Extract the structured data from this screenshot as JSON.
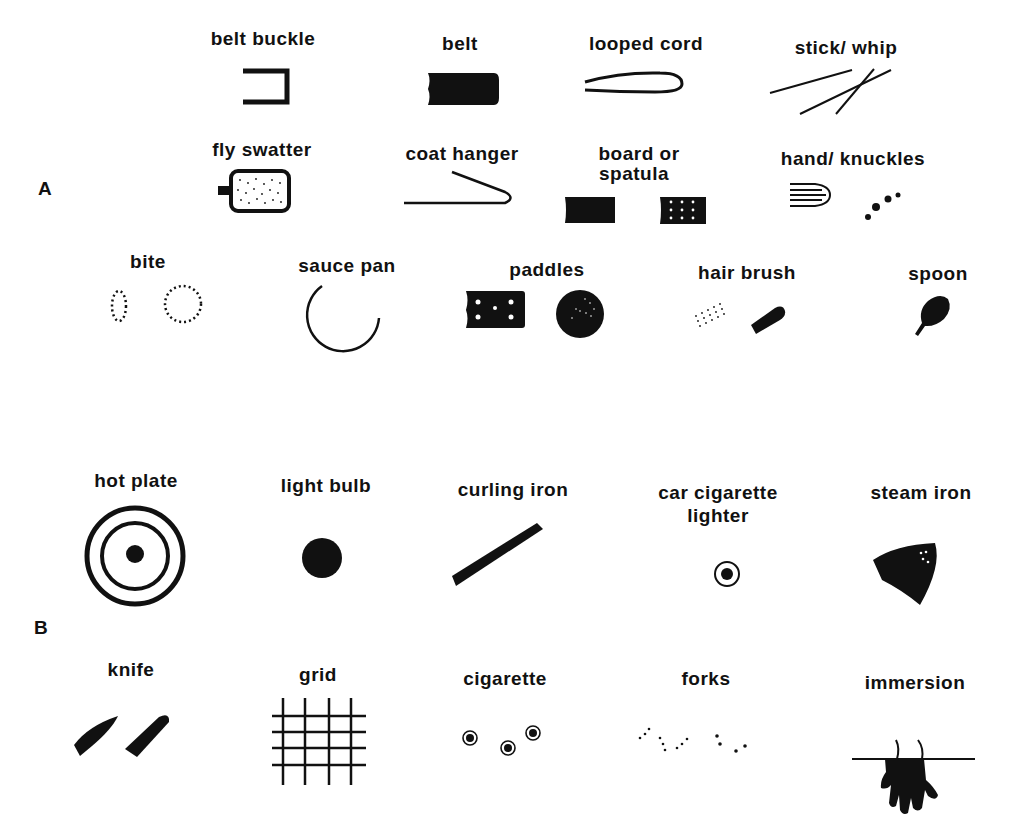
{
  "sections": {
    "A": {
      "label": "A"
    },
    "B": {
      "label": "B"
    }
  },
  "items": {
    "belt_buckle": {
      "label": "belt buckle"
    },
    "belt": {
      "label": "belt"
    },
    "looped_cord": {
      "label": "looped cord"
    },
    "stick_whip": {
      "label": "stick/ whip"
    },
    "fly_swatter": {
      "label": "fly  swatter"
    },
    "coat_hanger": {
      "label": "coat hanger"
    },
    "board_spatula": {
      "label_line1": "board or",
      "label_line2": "spatula"
    },
    "hand_knuckles": {
      "label": "hand/ knuckles"
    },
    "bite": {
      "label": "bite"
    },
    "sauce_pan": {
      "label": "sauce  pan"
    },
    "paddles": {
      "label": "paddles"
    },
    "hair_brush": {
      "label": "hair  brush"
    },
    "spoon": {
      "label": "spoon"
    },
    "hot_plate": {
      "label": "hot plate"
    },
    "light_bulb": {
      "label": "light bulb"
    },
    "curling_iron": {
      "label": "curling iron"
    },
    "car_cigarette_lighter": {
      "label_line1": "car  cigarette",
      "label_line2": "lighter"
    },
    "steam_iron": {
      "label": "steam iron"
    },
    "knife": {
      "label": "knife"
    },
    "grid": {
      "label": "grid"
    },
    "cigarette": {
      "label": "cigarette"
    },
    "forks": {
      "label": "forks"
    },
    "immersion": {
      "label": "immersion"
    }
  },
  "colors": {
    "ink": "#111111",
    "paper": "#ffffff"
  }
}
